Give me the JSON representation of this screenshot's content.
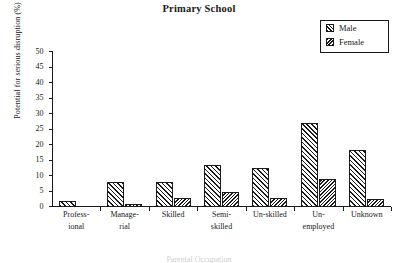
{
  "chart_data": {
    "type": "bar",
    "title": "Primary School",
    "xlabel": "Parental Occupation",
    "ylabel": "Potential for serious disruption (%)",
    "categories": [
      "Profess-ional",
      "Manage-rial",
      "Skilled",
      "Semi-skilled",
      "Un-skilled",
      "Un-employed",
      "Unknown"
    ],
    "category_lines": [
      [
        "Profess-",
        "ional"
      ],
      [
        "Manage-",
        "rial"
      ],
      [
        "Skilled",
        ""
      ],
      [
        "Semi-",
        "skilled"
      ],
      [
        "Un-skilled",
        ""
      ],
      [
        "Un-",
        "employed"
      ],
      [
        "Unknown",
        ""
      ]
    ],
    "series": [
      {
        "name": "Male",
        "values": [
          2,
          8,
          8,
          13.5,
          12.5,
          27,
          18.5
        ]
      },
      {
        "name": "Female",
        "values": [
          0,
          1,
          3,
          5,
          3,
          9,
          2.5
        ]
      }
    ],
    "ylim": [
      0,
      50
    ],
    "yticks": [
      0,
      5,
      10,
      15,
      20,
      25,
      30,
      35,
      40,
      45,
      50
    ],
    "ytick_labels": [
      "0",
      "5",
      "10",
      "15",
      "20",
      "25",
      "30",
      "35",
      "40",
      "45",
      "50"
    ],
    "grid": false,
    "legend": {
      "position": "top-right",
      "entries": [
        {
          "label": "Male",
          "pattern": "forward-diagonal-hatch"
        },
        {
          "label": "Female",
          "pattern": "back-diagonal-hatch"
        }
      ]
    },
    "colors": {
      "ink": "#1a1a1a",
      "background": "#ffffff",
      "male_fill": "#ffffff",
      "female_fill": "#ffffff"
    }
  },
  "caption": "Parental Occupation"
}
